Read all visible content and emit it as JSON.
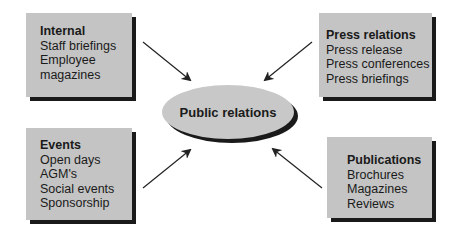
{
  "diagram": {
    "center": {
      "label": "Public relations"
    },
    "boxes": {
      "internal": {
        "title": "Internal",
        "items": [
          "Staff briefings",
          "Employee",
          "magazines"
        ]
      },
      "press": {
        "title": "Press relations",
        "items": [
          "Press release",
          "Press conferences",
          "Press briefings"
        ]
      },
      "events": {
        "title": "Events",
        "items": [
          "Open days",
          "AGM's",
          "Social events",
          "Sponsorship"
        ]
      },
      "publications": {
        "title": "Publications",
        "items": [
          "Brochures",
          "Magazines",
          "Reviews"
        ]
      }
    },
    "arrows": [
      {
        "from": "internal",
        "to": "center"
      },
      {
        "from": "press",
        "to": "center"
      },
      {
        "from": "events",
        "to": "center"
      },
      {
        "from": "publications",
        "to": "center"
      }
    ],
    "colors": {
      "box_fill": "#c4c4c4",
      "shadow": "#1a1a1a",
      "ellipse_fill": "#c8c8c8",
      "arrow": "#222222"
    }
  }
}
